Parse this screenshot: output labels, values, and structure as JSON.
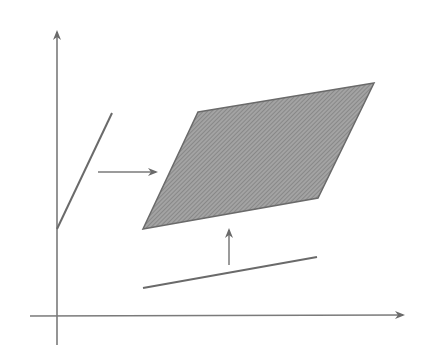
{
  "diagram": {
    "title": "",
    "colors": {
      "background": "#ffffff",
      "stroke": "#6a6a6a",
      "fill": "#9a9a9a",
      "hatch": "#7d7d7d"
    },
    "axes": {
      "vertical": {
        "x": 57,
        "y_top": 30,
        "y_bottom": 345,
        "arrow": "up"
      },
      "horizontal": {
        "y": 316,
        "x_left": 30,
        "x_right": 405,
        "arrow": "right"
      }
    },
    "shapes": {
      "parallelogram": {
        "points": [
          [
            198,
            112
          ],
          [
            374,
            83
          ],
          [
            318,
            198
          ],
          [
            143,
            229
          ]
        ],
        "shaded": true
      },
      "slanted_segment": {
        "x1": 57,
        "y1": 229,
        "x2": 112,
        "y2": 113
      },
      "bottom_segment": {
        "x1": 143,
        "y1": 288,
        "x2": 317,
        "y2": 257
      }
    },
    "arrows": {
      "right_arrow": {
        "x1": 98,
        "y1": 172,
        "x2": 156,
        "y2": 172
      },
      "up_arrow": {
        "x1": 229,
        "y1": 265,
        "x2": 229,
        "y2": 230
      }
    }
  }
}
